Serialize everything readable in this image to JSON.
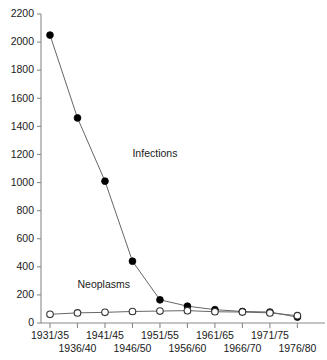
{
  "chart_data": {
    "type": "line",
    "title": "",
    "xlabel": "",
    "ylabel": "",
    "ylim": [
      0,
      2200
    ],
    "ytick_step": 200,
    "grid": false,
    "legend_position": "inline-annotation",
    "categories": [
      "1931/35",
      "1936/40",
      "1941/45",
      "1946/50",
      "1951/55",
      "1956/60",
      "1961/65",
      "1966/70",
      "1971/75",
      "1976/80"
    ],
    "yticks": [
      0,
      200,
      400,
      600,
      800,
      1000,
      1200,
      1400,
      1600,
      1800,
      2000,
      2200
    ],
    "series": [
      {
        "name": "Infections",
        "marker": "filled-circle",
        "color": "#000000",
        "values": [
          2050,
          1460,
          1010,
          440,
          165,
          120,
          95,
          82,
          78,
          42
        ]
      },
      {
        "name": "Neoplasms",
        "marker": "open-circle",
        "color": "#333333",
        "values": [
          62,
          72,
          76,
          82,
          85,
          88,
          80,
          78,
          72,
          52
        ]
      }
    ],
    "annotations": [
      {
        "text": "Infections",
        "x_category": "1946/50",
        "y_value": 1180
      },
      {
        "text": "Neoplasms",
        "x_category": "1936/40",
        "y_value": 250
      }
    ]
  },
  "axis": {
    "y_labels": [
      "2200",
      "2000",
      "1800",
      "1600",
      "1400",
      "1200",
      "1000",
      "800",
      "600",
      "400",
      "200",
      "0"
    ],
    "x_labels_top_row": [
      "1931/35",
      "1941/45",
      "1951/55",
      "1961/65",
      "1971/75"
    ],
    "x_labels_bottom_row": [
      "1936/40",
      "1946/50",
      "1956/60",
      "1966/70",
      "1976/80"
    ]
  },
  "colors": {
    "axis": "#8a8a8a",
    "line": "#666666",
    "infections_marker": "#000000",
    "neoplasms_marker": "#ffffff",
    "text": "#1a1a1a",
    "background": "#ffffff"
  }
}
